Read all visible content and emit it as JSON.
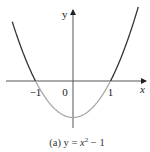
{
  "chart_data": {
    "type": "line",
    "title": "",
    "caption": {
      "prefix": "(a) y = ",
      "var": "x",
      "exp": "2",
      "suffix": " − 1"
    },
    "function": "y = x^2 - 1",
    "xlabel": "x",
    "ylabel": "y",
    "xlim": [
      -1.95,
      1.95
    ],
    "ylim": [
      -1.3,
      1.85
    ],
    "x_ticks": [
      {
        "value": -1,
        "label": "−1"
      },
      {
        "value": 0,
        "label": "0"
      },
      {
        "value": 1,
        "label": "1"
      }
    ],
    "series": [
      {
        "name": "y = x^2 - 1 (y ≥ 0 part)",
        "color": "#333333",
        "x_range": [
          -1.62,
          -1
        ],
        "region": "above-axis-left"
      },
      {
        "name": "y = x^2 - 1 (y < 0 part)",
        "color": "#a8a8a8",
        "x_range": [
          -1,
          1
        ],
        "region": "below-axis"
      },
      {
        "name": "y = x^2 - 1 (y ≥ 0 part)",
        "color": "#333333",
        "x_range": [
          1,
          1.74
        ],
        "region": "above-axis-right"
      }
    ],
    "grid": false,
    "legend": "none"
  }
}
